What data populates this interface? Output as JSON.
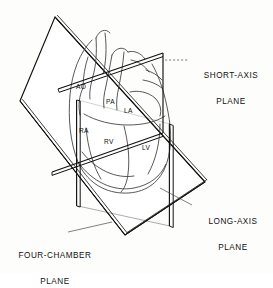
{
  "figure": {
    "background_color": "#fdfdfc",
    "line_color": "#111111",
    "plane_fill": "#ffffff"
  },
  "planes": [
    {
      "id": "short-axis",
      "label_line1": "SHORT-AXIS",
      "label_line2": "PLANE",
      "leader": "dashed-leader-line"
    },
    {
      "id": "long-axis",
      "label_line1": "LONG-AXIS",
      "label_line2": "PLANE",
      "leader": "dashed-leader-line"
    },
    {
      "id": "four-chamber",
      "label_line1": "FOUR-CHAMBER",
      "label_line2": "PLANE",
      "leader": "dashed-leader-line"
    }
  ],
  "anatomy_labels": [
    {
      "id": "ao",
      "text": "AO",
      "meaning": "aorta"
    },
    {
      "id": "pa",
      "text": "PA",
      "meaning": "pulmonary-artery"
    },
    {
      "id": "la",
      "text": "LA",
      "meaning": "left-atrium"
    },
    {
      "id": "ra",
      "text": "RA",
      "meaning": "right-atrium"
    },
    {
      "id": "rv",
      "text": "RV",
      "meaning": "right-ventricle"
    },
    {
      "id": "lv",
      "text": "LV",
      "meaning": "left-ventricle"
    }
  ]
}
